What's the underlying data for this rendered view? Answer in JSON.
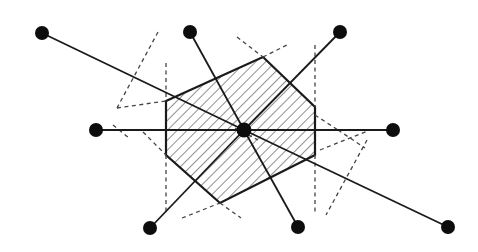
{
  "diagram": {
    "width": 478,
    "height": 252,
    "colors": {
      "background": "#ffffff",
      "stroke": "#1a1a1a",
      "dashed": "#444444",
      "hatch": "#333333",
      "point": "#0d0d0d"
    },
    "center": {
      "x": 244,
      "y": 130
    },
    "outer_points": [
      {
        "x": 42,
        "y": 33
      },
      {
        "x": 190,
        "y": 32
      },
      {
        "x": 340,
        "y": 32
      },
      {
        "x": 96,
        "y": 130
      },
      {
        "x": 393,
        "y": 130
      },
      {
        "x": 150,
        "y": 228
      },
      {
        "x": 298,
        "y": 227
      },
      {
        "x": 448,
        "y": 227
      }
    ],
    "hexagon": [
      [
        166,
        101
      ],
      [
        263,
        57
      ],
      [
        315,
        107
      ],
      [
        315,
        155
      ],
      [
        220,
        203
      ],
      [
        166,
        155
      ]
    ],
    "dashed_lines": [
      [
        [
          158,
          32
        ],
        [
          117,
          108
        ]
      ],
      [
        [
          166,
          63
        ],
        [
          166,
          101
        ]
      ],
      [
        [
          117,
          108
        ],
        [
          166,
          101
        ]
      ],
      [
        [
          113,
          125
        ],
        [
          129,
          138
        ]
      ],
      [
        [
          143,
          132
        ],
        [
          166,
          155
        ]
      ],
      [
        [
          166,
          155
        ],
        [
          166,
          215
        ]
      ],
      [
        [
          237,
          37
        ],
        [
          263,
          57
        ]
      ],
      [
        [
          263,
          57
        ],
        [
          287,
          45
        ]
      ],
      [
        [
          315,
          45
        ],
        [
          315,
          107
        ]
      ],
      [
        [
          315,
          155
        ],
        [
          315,
          215
        ]
      ],
      [
        [
          315,
          115
        ],
        [
          338,
          130
        ]
      ],
      [
        [
          338,
          130
        ],
        [
          365,
          148
        ]
      ],
      [
        [
          320,
          150
        ],
        [
          370,
          130
        ]
      ],
      [
        [
          367,
          140
        ],
        [
          326,
          215
        ]
      ],
      [
        [
          182,
          218
        ],
        [
          220,
          203
        ]
      ],
      [
        [
          220,
          203
        ],
        [
          241,
          218
        ]
      ],
      [
        [
          235,
          128
        ],
        [
          258,
          140
        ]
      ]
    ]
  }
}
